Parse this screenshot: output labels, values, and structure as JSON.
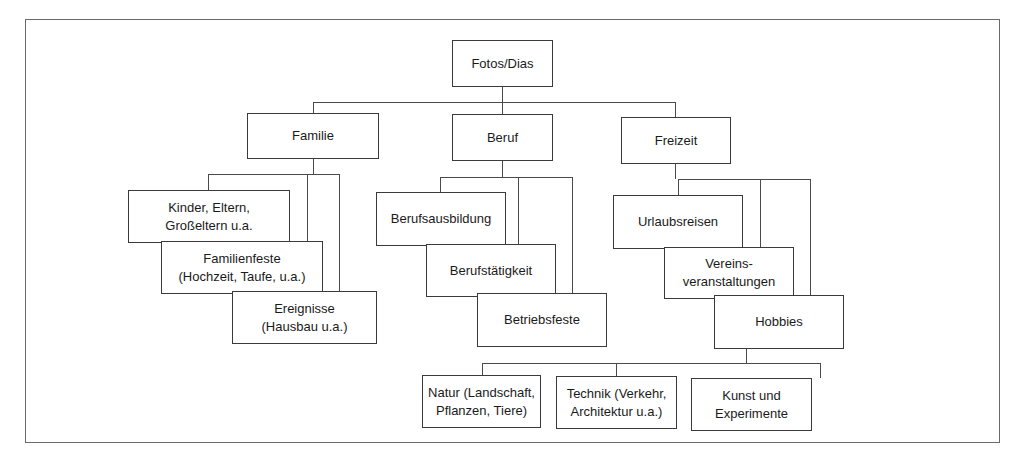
{
  "diagram": {
    "type": "tree",
    "root": {
      "id": "fotos",
      "label": "Fotos/Dias"
    },
    "nodes": [
      {
        "id": "fotos",
        "label": "Fotos/Dias",
        "parent": null
      },
      {
        "id": "familie",
        "label": "Familie",
        "parent": "fotos"
      },
      {
        "id": "beruf",
        "label": "Beruf",
        "parent": "fotos"
      },
      {
        "id": "freizeit",
        "label": "Freizeit",
        "parent": "fotos"
      },
      {
        "id": "kinder",
        "label": "Kinder, Eltern,\nGroßeltern u.a.",
        "parent": "familie"
      },
      {
        "id": "familienfeste",
        "label": "Familienfeste\n(Hochzeit, Taufe, u.a.)",
        "parent": "familie"
      },
      {
        "id": "ereignisse",
        "label": "Ereignisse\n(Hausbau u.a.)",
        "parent": "familie"
      },
      {
        "id": "berufsausbildung",
        "label": "Berufsausbildung",
        "parent": "beruf"
      },
      {
        "id": "berufstaetigkeit",
        "label": "Berufstätigkeit",
        "parent": "beruf"
      },
      {
        "id": "betriebsfeste",
        "label": "Betriebsfeste",
        "parent": "beruf"
      },
      {
        "id": "urlaubsreisen",
        "label": "Urlaubsreisen",
        "parent": "freizeit"
      },
      {
        "id": "vereins",
        "label": "Vereins-\nveranstaltungen",
        "parent": "freizeit"
      },
      {
        "id": "hobbies",
        "label": "Hobbies",
        "parent": "freizeit"
      },
      {
        "id": "natur",
        "label": "Natur (Landschaft,\nPflanzen, Tiere)",
        "parent": "hobbies"
      },
      {
        "id": "technik",
        "label": "Technik (Verkehr,\nArchitektur u.a.)",
        "parent": "hobbies"
      },
      {
        "id": "kunst",
        "label": "Kunst und\nExperimente",
        "parent": "hobbies"
      }
    ]
  },
  "labels": {
    "fotos": "Fotos/Dias",
    "familie": "Familie",
    "beruf": "Beruf",
    "freizeit": "Freizeit",
    "kinder": "Kinder, Eltern,\nGroßeltern u.a.",
    "familienfeste": "Familienfeste\n(Hochzeit, Taufe, u.a.)",
    "ereignisse": "Ereignisse\n(Hausbau u.a.)",
    "berufsausbildung": "Berufsausbildung",
    "berufstaetigkeit": "Berufstätigkeit",
    "betriebsfeste": "Betriebsfeste",
    "urlaubsreisen": "Urlaubsreisen",
    "vereins": "Vereins-\nveranstaltungen",
    "hobbies": "Hobbies",
    "natur": "Natur (Landschaft,\nPflanzen, Tiere)",
    "technik": "Technik (Verkehr,\nArchitektur u.a.)",
    "kunst": "Kunst und\nExperimente"
  },
  "colors": {
    "line": "#4a4a4a",
    "border": "#3a3a3a",
    "background": "#ffffff",
    "text": "#1a1a1a"
  }
}
